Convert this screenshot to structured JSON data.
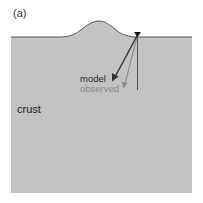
{
  "panel_label": "(a)",
  "labels": {
    "crust": "crust",
    "model": "model",
    "observed": "observed"
  },
  "colors": {
    "background": "#ffffff",
    "crust_fill": "#c3c3c3",
    "surface_line": "#555555",
    "model_arrow": "#333333",
    "observed_arrow": "#8c8c8c",
    "vertical_line": "#444444",
    "station": "#111111",
    "model_text": "#2a2a2a",
    "observed_text": "#8a8a8a",
    "crust_text": "#1a1a1a"
  },
  "icons": {
    "station": "inverted-triangle"
  }
}
